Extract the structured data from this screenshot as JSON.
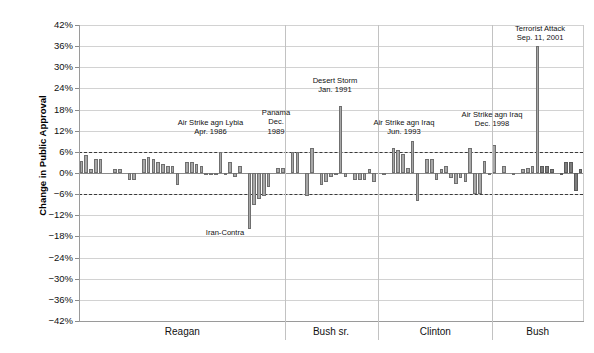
{
  "chart_data": {
    "type": "bar",
    "title": "",
    "xlabel": "",
    "ylabel": "Change in Public Approval",
    "ylim": [
      -42,
      42
    ],
    "ytick_labels": [
      "42%",
      "36%",
      "30%",
      "24%",
      "18%",
      "12%",
      "6%",
      "0%",
      "-6%",
      "-12%",
      "-18%",
      "-24%",
      "-30%",
      "-36%",
      "-42%"
    ],
    "ytick_values": [
      42,
      36,
      30,
      24,
      18,
      12,
      6,
      0,
      -6,
      -12,
      -18,
      -24,
      -30,
      -36,
      -42
    ],
    "grid": true,
    "legend": "none",
    "reference_lines": [
      6,
      -6
    ],
    "groups": [
      {
        "name": "Reagan",
        "label": "Reagan"
      },
      {
        "name": "Bush sr.",
        "label": "Bush sr."
      },
      {
        "name": "Clinton",
        "label": "Clinton"
      },
      {
        "name": "Bush",
        "label": "Bush"
      }
    ],
    "values": [
      3.5,
      5.0,
      1.0,
      4.0,
      4.0,
      0.0,
      0.0,
      1.0,
      1.0,
      0.0,
      -2.0,
      -2.0,
      0.0,
      4.0,
      4.5,
      4.0,
      3.0,
      2.5,
      2.0,
      2.0,
      -3.5,
      0.0,
      3.0,
      3.0,
      2.5,
      2.0,
      -0.5,
      -0.5,
      -0.5,
      6.0,
      -0.5,
      3.0,
      -1.0,
      2.0,
      0.0,
      -16.0,
      -9.0,
      -7.5,
      -6.5,
      -4.0,
      0.0,
      1.5,
      1.5,
      0.0,
      6.0,
      6.0,
      0.0,
      -6.5,
      7.0,
      0.0,
      -3.5,
      -2.5,
      -1.0,
      -0.5,
      19.0,
      -1.0,
      0.0,
      -2.0,
      -2.0,
      -2.0,
      1.0,
      -2.5,
      0.0,
      -0.5,
      0.0,
      7.0,
      6.5,
      5.5,
      1.5,
      9.0,
      -8.0,
      0.0,
      4.0,
      4.0,
      -2.0,
      1.0,
      2.0,
      -1.5,
      -3.0,
      -1.5,
      -2.5,
      7.0,
      -6.0,
      -6.0,
      3.5,
      -0.5,
      8.0,
      0.0,
      2.0,
      0.0,
      -0.5,
      0.0,
      1.0,
      1.5,
      2.0,
      36.0,
      2.0,
      2.0,
      1.0,
      0.0,
      -0.5,
      3.0,
      3.0,
      -5.0,
      1.0
    ],
    "annotations": [
      {
        "id": "lybia",
        "lines": [
          "Air Strike agn Lybia",
          "Apr. 1986"
        ],
        "position": "above"
      },
      {
        "id": "iran-contra",
        "lines": [
          "Iran-Contra"
        ],
        "position": "below"
      },
      {
        "id": "panama",
        "lines": [
          "Panama",
          "Dec.",
          "1989"
        ],
        "position": "above"
      },
      {
        "id": "desert-storm",
        "lines": [
          "Desert Storm",
          "Jan. 1991"
        ],
        "position": "above"
      },
      {
        "id": "iraq-1993",
        "lines": [
          "Air Strike agn Iraq",
          "Jun. 1993"
        ],
        "position": "above"
      },
      {
        "id": "iraq-1998",
        "lines": [
          "Air Strike agn Iraq",
          "Dec. 1998"
        ],
        "position": "above"
      },
      {
        "id": "sep11",
        "lines": [
          "Terrorist Attack",
          "Sep. 11, 2001"
        ],
        "position": "above"
      }
    ],
    "colors": {
      "bar_fill": "#a8a8a8",
      "bar_fill_dark": "#7d7d7d",
      "bar_stroke": "#6f6f6f",
      "grid": "#d2d2d2",
      "axis": "#8a8a8a",
      "reference_line": "#3a3a3a",
      "text": "#111111",
      "background": "#ffffff"
    }
  },
  "axis": {
    "y_title": "Change in Public Approval",
    "ticks": [
      {
        "label": "42%"
      },
      {
        "label": "36%"
      },
      {
        "label": "30%"
      },
      {
        "label": "24%"
      },
      {
        "label": "18%"
      },
      {
        "label": "12%"
      },
      {
        "label": "6%"
      },
      {
        "label": "0%"
      },
      {
        "label": "-6%"
      },
      {
        "label": "-12%"
      },
      {
        "label": "-18%"
      },
      {
        "label": "-24%"
      },
      {
        "label": "-30%"
      },
      {
        "label": "-36%"
      },
      {
        "label": "-42%"
      }
    ]
  },
  "presidencies": [
    {
      "label": "Reagan"
    },
    {
      "label": "Bush sr."
    },
    {
      "label": "Clinton"
    },
    {
      "label": "Bush"
    }
  ],
  "annotations": {
    "lybia": {
      "line1": "Air Strike agn Lybia",
      "line2": "Apr. 1986"
    },
    "iran_contra": {
      "line1": "Iran-Contra"
    },
    "panama": {
      "line1": "Panama",
      "line2": "Dec.",
      "line3": "1989"
    },
    "desert_storm": {
      "line1": "Desert Storm",
      "line2": "Jan. 1991"
    },
    "iraq_1993": {
      "line1": "Air Strike agn Iraq",
      "line2": "Jun. 1993"
    },
    "iraq_1998": {
      "line1": "Air Strike agn Iraq",
      "line2": "Dec. 1998"
    },
    "sep11": {
      "line1": "Terrorist Attack",
      "line2": "Sep. 11, 2001"
    }
  }
}
